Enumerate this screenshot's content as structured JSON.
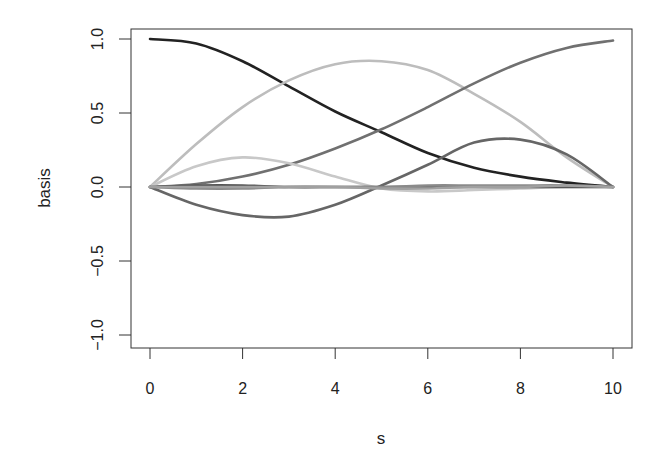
{
  "chart_data": {
    "type": "line",
    "title": "",
    "xlabel": "s",
    "ylabel": "basis",
    "xlim": [
      0,
      10
    ],
    "ylim": [
      -1.0,
      1.0
    ],
    "grid": false,
    "legend": null,
    "x_ticks": [
      0,
      2,
      4,
      6,
      8,
      10
    ],
    "x_tick_labels": [
      "0",
      "2",
      "4",
      "6",
      "8",
      "10"
    ],
    "y_ticks": [
      -1.0,
      -0.5,
      0.0,
      0.5,
      1.0
    ],
    "y_tick_labels": [
      "−1.0",
      "−0.5",
      "0.0",
      "0.5",
      "1.0"
    ],
    "x": [
      0,
      1,
      2,
      3,
      4,
      5,
      6,
      7,
      8,
      9,
      10
    ],
    "series": [
      {
        "name": "basis-1",
        "color": "#222222",
        "values": [
          1.0,
          0.97,
          0.85,
          0.68,
          0.51,
          0.37,
          0.23,
          0.13,
          0.07,
          0.03,
          0.0
        ]
      },
      {
        "name": "basis-2",
        "color": "#bdbdbd",
        "values": [
          0.0,
          0.29,
          0.54,
          0.72,
          0.83,
          0.85,
          0.79,
          0.63,
          0.44,
          0.2,
          0.0
        ]
      },
      {
        "name": "basis-3",
        "color": "#707070",
        "values": [
          0.0,
          0.02,
          0.07,
          0.15,
          0.26,
          0.39,
          0.54,
          0.7,
          0.84,
          0.94,
          0.99
        ]
      },
      {
        "name": "basis-4",
        "color": "#c8c8c8",
        "values": [
          0.0,
          0.14,
          0.2,
          0.16,
          0.07,
          -0.01,
          -0.03,
          -0.02,
          -0.01,
          0.0,
          0.0
        ]
      },
      {
        "name": "basis-5",
        "color": "#666666",
        "values": [
          0.0,
          -0.12,
          -0.19,
          -0.2,
          -0.12,
          0.01,
          0.15,
          0.3,
          0.32,
          0.22,
          0.0
        ]
      },
      {
        "name": "basis-6",
        "color": "#555555",
        "values": [
          0.0,
          0.01,
          0.01,
          0.0,
          0.0,
          0.0,
          0.0,
          0.0,
          0.0,
          0.0,
          0.0
        ]
      },
      {
        "name": "basis-7",
        "color": "#8a8a8a",
        "values": [
          0.0,
          -0.01,
          -0.01,
          0.0,
          0.0,
          0.0,
          0.01,
          0.01,
          0.01,
          0.01,
          0.0
        ]
      },
      {
        "name": "basis-8",
        "color": "#a0a0a0",
        "values": [
          0.0,
          0.0,
          0.0,
          0.0,
          0.0,
          -0.01,
          -0.01,
          0.0,
          0.0,
          0.01,
          0.0
        ]
      }
    ]
  }
}
